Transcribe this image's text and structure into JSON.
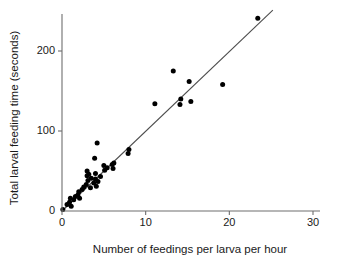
{
  "chart_data": {
    "type": "scatter",
    "title": "",
    "xlabel": "Number of feedings per larva per hour",
    "ylabel": "Total larval feeding time (seconds)",
    "xlim": [
      0,
      30
    ],
    "ylim": [
      0,
      250
    ],
    "xticks": [
      0,
      10,
      20,
      30
    ],
    "yticks": [
      0,
      100,
      200
    ],
    "xticklabels": [
      "0",
      "10",
      "20",
      "30"
    ],
    "yticklabels": [
      "0",
      "100",
      "200"
    ],
    "grid": false,
    "legend": null,
    "series": [
      {
        "name": "larval feeding observations",
        "marker": "filled-circle",
        "color": "#000000",
        "points": [
          [
            0.1,
            2
          ],
          [
            0.6,
            8
          ],
          [
            0.9,
            11
          ],
          [
            1.0,
            16
          ],
          [
            1.1,
            6
          ],
          [
            1.4,
            14
          ],
          [
            1.6,
            18
          ],
          [
            1.9,
            20
          ],
          [
            2.0,
            24
          ],
          [
            2.1,
            16
          ],
          [
            2.4,
            27
          ],
          [
            2.6,
            30
          ],
          [
            2.9,
            33
          ],
          [
            3.0,
            44
          ],
          [
            3.0,
            50
          ],
          [
            3.1,
            38
          ],
          [
            3.2,
            46
          ],
          [
            3.4,
            29
          ],
          [
            3.5,
            41
          ],
          [
            3.8,
            35
          ],
          [
            3.9,
            66
          ],
          [
            4.0,
            40
          ],
          [
            4.0,
            47
          ],
          [
            4.1,
            31
          ],
          [
            4.2,
            85
          ],
          [
            4.3,
            37
          ],
          [
            4.6,
            43
          ],
          [
            5.0,
            57
          ],
          [
            5.1,
            51
          ],
          [
            5.4,
            54
          ],
          [
            6.0,
            58
          ],
          [
            6.1,
            53
          ],
          [
            6.2,
            60
          ],
          [
            7.9,
            72
          ],
          [
            8.0,
            77
          ],
          [
            11.1,
            134
          ],
          [
            13.3,
            175
          ],
          [
            14.1,
            133
          ],
          [
            14.2,
            140
          ],
          [
            15.2,
            162
          ],
          [
            15.4,
            137
          ],
          [
            19.2,
            158
          ],
          [
            23.4,
            241
          ]
        ]
      }
    ],
    "fit_line": {
      "name": "least-squares trend line",
      "color": "#4d4d4d",
      "x_start": 0,
      "y_start": 0,
      "x_end": 25.2,
      "y_end": 251
    }
  }
}
